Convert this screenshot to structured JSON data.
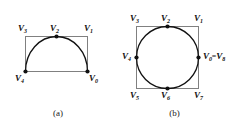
{
  "figure": {
    "background_color": "#ffffff",
    "outline_color": "#808080",
    "curve_color": "#111111",
    "vertex_color": "#111111",
    "label_color": "#111111"
  },
  "panels": [
    {
      "id": "a",
      "caption": "(a)",
      "shape_outline": "rectangle",
      "shape_curve": "semicircular-arc",
      "vertices": [
        {
          "key": "v3",
          "base": "V",
          "sub": "3",
          "text": "V3"
        },
        {
          "key": "v2",
          "base": "V",
          "sub": "2",
          "text": "V2"
        },
        {
          "key": "v1",
          "base": "V",
          "sub": "1",
          "text": "V1"
        },
        {
          "key": "v4",
          "base": "V",
          "sub": "4",
          "text": "V4"
        },
        {
          "key": "v0",
          "base": "V",
          "sub": "0",
          "text": "V0"
        }
      ]
    },
    {
      "id": "b",
      "caption": "(b)",
      "shape_outline": "square",
      "shape_curve": "inscribed-circle",
      "vertices": [
        {
          "key": "v3",
          "base": "V",
          "sub": "3",
          "text": "V3"
        },
        {
          "key": "v2",
          "base": "V",
          "sub": "2",
          "text": "V2"
        },
        {
          "key": "v1",
          "base": "V",
          "sub": "1",
          "text": "V1"
        },
        {
          "key": "v4",
          "base": "V",
          "sub": "4",
          "text": "V4"
        },
        {
          "key": "v0v8",
          "base": "V",
          "sub": "0",
          "base2": "V",
          "sub2": "8",
          "eq": "=",
          "text": "V0=V8"
        },
        {
          "key": "v5",
          "base": "V",
          "sub": "5",
          "text": "V5"
        },
        {
          "key": "v6",
          "base": "V",
          "sub": "6",
          "text": "V6"
        },
        {
          "key": "v7",
          "base": "V",
          "sub": "7",
          "text": "V7"
        }
      ]
    }
  ],
  "labels": {
    "a_v3": "V",
    "a_v3_sub": "3",
    "a_v2": "V",
    "a_v2_sub": "2",
    "a_v1": "V",
    "a_v1_sub": "1",
    "a_v4": "V",
    "a_v4_sub": "4",
    "a_v0": "V",
    "a_v0_sub": "0",
    "b_v3": "V",
    "b_v3_sub": "3",
    "b_v2": "V",
    "b_v2_sub": "2",
    "b_v1": "V",
    "b_v1_sub": "1",
    "b_v4": "V",
    "b_v4_sub": "4",
    "b_v0": "V",
    "b_v0_sub": "0",
    "b_eq": "=",
    "b_v8": "V",
    "b_v8_sub": "8",
    "b_v5": "V",
    "b_v5_sub": "5",
    "b_v6": "V",
    "b_v6_sub": "6",
    "b_v7": "V",
    "b_v7_sub": "7",
    "caption_a": "(a)",
    "caption_b": "(b)"
  }
}
